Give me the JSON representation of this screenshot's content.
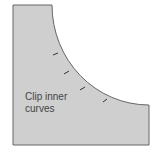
{
  "diagram": {
    "label_line1": "Clip inner",
    "label_line2": "curves",
    "fabric_color": "#cfcfcf",
    "edge_color": "#666666",
    "clip_mark_count": 4
  }
}
